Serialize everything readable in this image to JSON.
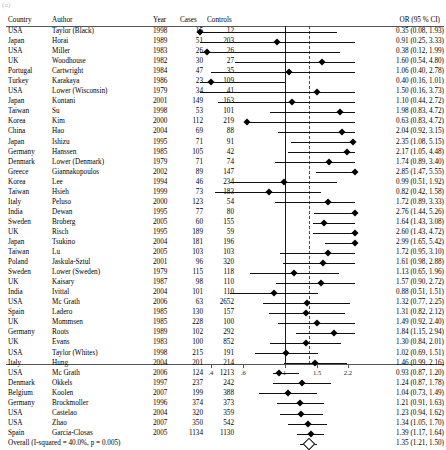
{
  "figure": {
    "corner_artifact": "(a)",
    "axis": {
      "tick_labels": [
        ".4",
        ".6",
        "1",
        "1.5",
        "2.2"
      ],
      "tick_values": [
        0.4,
        0.6,
        1,
        1.5,
        2.2
      ],
      "null_value": 1,
      "pooled_value": 1.35,
      "scale": "log"
    },
    "columns": {
      "country": "Country",
      "author": "Author",
      "year": "Year",
      "cases": "Cases",
      "controls": "Controls",
      "or": "OR (95 % CI)"
    },
    "overall_label": "Overall (I-squared = 40.0%, p = 0.005)"
  },
  "chart_data": {
    "type": "forest",
    "title": "",
    "xlabel": "",
    "ylabel": "",
    "xscale": "log",
    "xlim": [
      0.35,
      2.4
    ],
    "null_line": 1,
    "pooled_line": 1.35,
    "grid": false,
    "legend": "none",
    "columns": [
      "Country",
      "Author",
      "Year",
      "Cases",
      "Controls",
      "OR (95 % CI)"
    ],
    "rows": [
      {
        "country": "USA",
        "author": "Taylor (Black)",
        "year": "1998",
        "cases": "15",
        "controls": "12",
        "or": 0.35,
        "lo": 0.08,
        "hi": 1.93,
        "or_text": "0.35 (0.08, 1.93)"
      },
      {
        "country": "Japan",
        "author": "Horai",
        "year": "1989",
        "cases": "51",
        "controls": "203",
        "or": 0.91,
        "lo": 0.25,
        "hi": 3.33,
        "or_text": "0.91 (0.25, 3.33)"
      },
      {
        "country": "USA",
        "author": "Miller",
        "year": "1983",
        "cases": "26",
        "controls": "26",
        "or": 0.38,
        "lo": 0.12,
        "hi": 1.99,
        "or_text": "0.38 (0.12, 1.99)"
      },
      {
        "country": "UK",
        "author": "Woodhouse",
        "year": "1982",
        "cases": "30",
        "controls": "27",
        "or": 1.6,
        "lo": 0.54,
        "hi": 4.8,
        "or_text": "1.60 (0.54, 4.80)"
      },
      {
        "country": "Portugal",
        "author": "Cartwright",
        "year": "1984",
        "cases": "47",
        "controls": "35",
        "or": 1.06,
        "lo": 0.4,
        "hi": 2.78,
        "or_text": "1.06 (0.40, 2.78)"
      },
      {
        "country": "Turkey",
        "author": "Karakaya",
        "year": "1986",
        "cases": "23",
        "controls": "109",
        "or": 0.4,
        "lo": 0.16,
        "hi": 1.01,
        "or_text": "0.40 (0.16, 1.01)"
      },
      {
        "country": "USA",
        "author": "Lower (Wisconsin)",
        "year": "1979",
        "cases": "34",
        "controls": "41",
        "or": 1.5,
        "lo": 0.16,
        "hi": 3.73,
        "or_text": "1.50 (0.16, 3.73)"
      },
      {
        "country": "Japan",
        "author": "Kontani",
        "year": "2001",
        "cases": "149",
        "controls": "163",
        "or": 1.1,
        "lo": 0.44,
        "hi": 2.72,
        "or_text": "1.10 (0.44, 2.72)"
      },
      {
        "country": "Taiwan",
        "author": "Su",
        "year": "1998",
        "cases": "53",
        "controls": "101",
        "or": 1.98,
        "lo": 0.83,
        "hi": 4.72,
        "or_text": "1.98 (0.83, 4.72)"
      },
      {
        "country": "Korea",
        "author": "Kim",
        "year": "2000",
        "cases": "112",
        "controls": "219",
        "or": 0.63,
        "lo": 0.83,
        "hi": 4.72,
        "or_text": "0.63 (0.83, 4.72)"
      },
      {
        "country": "China",
        "author": "Hao",
        "year": "2004",
        "cases": "69",
        "controls": "88",
        "or": 2.04,
        "lo": 0.92,
        "hi": 3.15,
        "or_text": "2.04 (0.92, 3.15)"
      },
      {
        "country": "Japan",
        "author": "Ishizu",
        "year": "1995",
        "cases": "71",
        "controls": "91",
        "or": 2.35,
        "lo": 1.08,
        "hi": 5.15,
        "or_text": "2.35 (1.08, 5.15)"
      },
      {
        "country": "Germany",
        "author": "Hanssen",
        "year": "1985",
        "cases": "105",
        "controls": "42",
        "or": 2.17,
        "lo": 1.05,
        "hi": 4.48,
        "or_text": "2.17 (1.05, 4.48)"
      },
      {
        "country": "Denmark",
        "author": "Lower (Denmark)",
        "year": "1979",
        "cases": "71",
        "controls": "74",
        "or": 1.74,
        "lo": 0.89,
        "hi": 3.4,
        "or_text": "1.74 (0.89, 3.40)"
      },
      {
        "country": "Greece",
        "author": "Giannakopoulos",
        "year": "2002",
        "cases": "89",
        "controls": "147",
        "or": 2.85,
        "lo": 1.47,
        "hi": 5.55,
        "or_text": "2.85 (1.47, 5.55)"
      },
      {
        "country": "Korea",
        "author": "Lee",
        "year": "1994",
        "cases": "46",
        "controls": "234",
        "or": 0.99,
        "lo": 0.51,
        "hi": 1.92,
        "or_text": "0.99 (0.51, 1.92)"
      },
      {
        "country": "Taiwan",
        "author": "Hsieh",
        "year": "1999",
        "cases": "73",
        "controls": "183",
        "or": 0.82,
        "lo": 0.42,
        "hi": 1.58,
        "or_text": "0.82 (0.42, 1.58)"
      },
      {
        "country": "Italy",
        "author": "Peluso",
        "year": "2000",
        "cases": "123",
        "controls": "54",
        "or": 1.72,
        "lo": 0.89,
        "hi": 3.33,
        "or_text": "1.72 (0.89, 3.33)"
      },
      {
        "country": "India",
        "author": "Dewan",
        "year": "1995",
        "cases": "77",
        "controls": "80",
        "or": 2.76,
        "lo": 1.44,
        "hi": 5.26,
        "or_text": "2.76 (1.44, 5.26)"
      },
      {
        "country": "Sweden",
        "author": "Broberg",
        "year": "2005",
        "cases": "60",
        "controls": "155",
        "or": 1.64,
        "lo": 1.43,
        "hi": 3.08,
        "or_text": "1.64 (1.43, 3.08)"
      },
      {
        "country": "UK",
        "author": "Risch",
        "year": "1995",
        "cases": "189",
        "controls": "59",
        "or": 2.6,
        "lo": 1.43,
        "hi": 4.72,
        "or_text": "2.60 (1.43, 4.72)"
      },
      {
        "country": "Japan",
        "author": "Tsukino",
        "year": "2004",
        "cases": "181",
        "controls": "196",
        "or": 2.99,
        "lo": 1.65,
        "hi": 5.42,
        "or_text": "2.99 (1.65, 5.42)"
      },
      {
        "country": "Taiwan",
        "author": "Lu",
        "year": "2005",
        "cases": "103",
        "controls": "103",
        "or": 1.72,
        "lo": 0.95,
        "hi": 3.1,
        "or_text": "1.72 (0.95, 3.10)"
      },
      {
        "country": "Poland",
        "author": "Jaskula-Sztul",
        "year": "2001",
        "cases": "96",
        "controls": "320",
        "or": 1.61,
        "lo": 0.98,
        "hi": 2.88,
        "or_text": "1.61 (0.98, 2.88)"
      },
      {
        "country": "Sweden",
        "author": "Lower (Sweden)",
        "year": "1979",
        "cases": "115",
        "controls": "118",
        "or": 1.13,
        "lo": 0.65,
        "hi": 1.96,
        "or_text": "1.13 (0.65, 1.96)"
      },
      {
        "country": "UK",
        "author": "Kaisary",
        "year": "1987",
        "cases": "98",
        "controls": "110",
        "or": 1.57,
        "lo": 0.9,
        "hi": 2.72,
        "or_text": "1.57 (0.90, 2.72)"
      },
      {
        "country": "India",
        "author": "Ivittal",
        "year": "2004",
        "cases": "101",
        "controls": "110",
        "or": 0.88,
        "lo": 0.51,
        "hi": 1.51,
        "or_text": "0.88 (0.51, 1.51)"
      },
      {
        "country": "USA",
        "author": "Mc Grath",
        "year": "2006",
        "cases": "63",
        "controls": "2652",
        "or": 1.32,
        "lo": 0.77,
        "hi": 2.25,
        "or_text": "1.32 (0.77, 2.25)"
      },
      {
        "country": "Spain",
        "author": "Ladero",
        "year": "1985",
        "cases": "130",
        "controls": "157",
        "or": 1.31,
        "lo": 0.82,
        "hi": 2.12,
        "or_text": "1.31 (0.82, 2.12)"
      },
      {
        "country": "UK",
        "author": "Mommsen",
        "year": "1985",
        "cases": "228",
        "controls": "100",
        "or": 1.49,
        "lo": 0.92,
        "hi": 2.4,
        "or_text": "1.49 (0.92, 2.40)"
      },
      {
        "country": "Germany",
        "author": "Roots",
        "year": "1989",
        "cases": "102",
        "controls": "292",
        "or": 1.84,
        "lo": 1.15,
        "hi": 2.94,
        "or_text": "1.84 (1.15, 2.94)"
      },
      {
        "country": "UK",
        "author": "Evans",
        "year": "1983",
        "cases": "100",
        "controls": "852",
        "or": 1.3,
        "lo": 0.84,
        "hi": 2.01,
        "or_text": "1.30 (0.84, 2.01)"
      },
      {
        "country": "USA",
        "author": "Taylor (Whites)",
        "year": "1998",
        "cases": "215",
        "controls": "191",
        "or": 1.02,
        "lo": 0.69,
        "hi": 1.51,
        "or_text": "1.02 (0.69, 1.51)"
      },
      {
        "country": "Italy",
        "author": "Hung",
        "year": "2004",
        "cases": "201",
        "controls": "214",
        "or": 1.46,
        "lo": 0.99,
        "hi": 2.16,
        "or_text": "1.46 (0.99, 2.16)"
      },
      {
        "country": "USA",
        "author": "Mc Grath",
        "year": "2006",
        "cases": "124",
        "controls": "1213",
        "or": 0.93,
        "lo": 0.87,
        "hi": 1.2,
        "or_text": "0.93 (0.87, 1.20)"
      },
      {
        "country": "Denmark",
        "author": "Okkels",
        "year": "1997",
        "cases": "237",
        "controls": "242",
        "or": 1.24,
        "lo": 0.87,
        "hi": 1.78,
        "or_text": "1.24 (0.87, 1.78)"
      },
      {
        "country": "Belgium",
        "author": "Koolen",
        "year": "2007",
        "cases": "199",
        "controls": "388",
        "or": 1.04,
        "lo": 0.73,
        "hi": 1.49,
        "or_text": "1.04 (0.73, 1.49)"
      },
      {
        "country": "Germany",
        "author": "Brockmoller",
        "year": "1996",
        "cases": "374",
        "controls": "373",
        "or": 1.21,
        "lo": 0.91,
        "hi": 1.63,
        "or_text": "1.21 (0.91, 1.63)"
      },
      {
        "country": "USA",
        "author": "Castelao",
        "year": "2004",
        "cases": "320",
        "controls": "359",
        "or": 1.23,
        "lo": 0.94,
        "hi": 1.62,
        "or_text": "1.23 (0.94, 1.62)"
      },
      {
        "country": "USA",
        "author": "Zhao",
        "year": "2007",
        "cases": "350",
        "controls": "542",
        "or": 1.34,
        "lo": 1.05,
        "hi": 1.7,
        "or_text": "1.34 (1.05, 1.70)"
      },
      {
        "country": "Spain",
        "author": "Garcia-Closas",
        "year": "2005",
        "cases": "1134",
        "controls": "1130",
        "or": 1.39,
        "lo": 1.17,
        "hi": 1.64,
        "or_text": "1.39 (1.17, 1.64)"
      }
    ],
    "overall": {
      "label": "Overall (I-squared = 40.0%, p = 0.005)",
      "or": 1.35,
      "lo": 1.21,
      "hi": 1.5,
      "or_text": "1.35 (1.21, 1.50)"
    }
  }
}
